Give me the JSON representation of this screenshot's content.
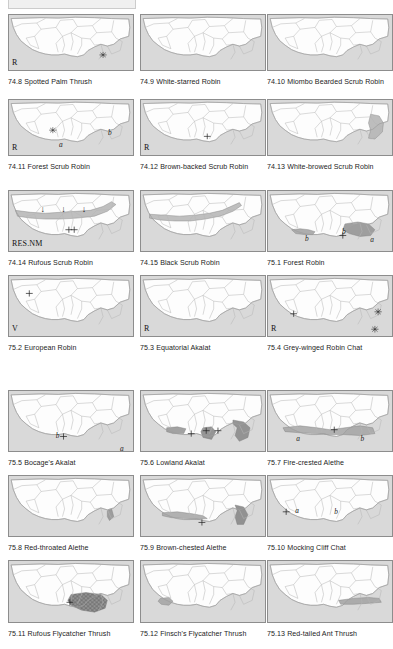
{
  "page": {
    "width": 388,
    "height": 649,
    "background": "#ffffff",
    "kind": "field-guide distribution map plate",
    "columns": 3,
    "rows": 7
  },
  "style": {
    "sea_fill": "#d9d9d9",
    "land_fill": "#fdfdfd",
    "border_stroke": "#8d8d8d",
    "country_stroke": "#b5b5b5",
    "range_light": "#b9b9b9",
    "range_dark": "#8a8a8a",
    "range_hatch": "#6f6f6f"
  },
  "legend_symbols": {
    "asterisk": "*",
    "cross": "+",
    "arrow_down": "↓",
    "subrange_a": "a",
    "subrange_b": "b"
  },
  "panels": [
    {
      "number": "74.8",
      "name": "Spotted Palm Thrush",
      "caption": "74.8 Spotted Palm Thrush",
      "status": "R",
      "markers": [
        {
          "symbol": "*",
          "x": 88,
          "y": 45
        }
      ],
      "labels": [],
      "ranges": []
    },
    {
      "number": "74.9",
      "name": "White-starred Robin",
      "caption": "74.9 White-starred Robin",
      "status": "",
      "markers": [],
      "labels": [],
      "ranges": []
    },
    {
      "number": "74.10",
      "name": "Miombo Bearded Scrub Robin",
      "caption": "74.10 Miombo Bearded Scrub Robin",
      "status": "",
      "markers": [],
      "labels": [],
      "ranges": []
    },
    {
      "number": "74.11",
      "name": "Forest Scrub Robin",
      "caption": "74.11 Forest Scrub Robin",
      "status": "R",
      "markers": [
        {
          "symbol": "*",
          "x": 41,
          "y": 34
        }
      ],
      "labels": [
        {
          "text": "a",
          "x": 47,
          "y": 46
        },
        {
          "text": "b",
          "x": 92,
          "y": 33
        }
      ],
      "ranges": []
    },
    {
      "number": "74.12",
      "name": "Brown-backed Scrub Robin",
      "caption": "74.12 Brown-backed Scrub Robin",
      "status": "R",
      "markers": [
        {
          "symbol": "+",
          "x": 62,
          "y": 41
        }
      ],
      "labels": [],
      "ranges": []
    },
    {
      "number": "74.13",
      "name": "White-browed Scrub Robin",
      "caption": "74.13 White-browed Scrub Robin",
      "status": "",
      "markers": [],
      "labels": [],
      "ranges": [
        "east-coastal-band"
      ]
    },
    {
      "number": "74.14",
      "name": "Rufous Scrub Robin",
      "caption": "74.14 Rufous Scrub Robin",
      "status": "RES.NM",
      "markers": [
        {
          "symbol": "+",
          "x": 56,
          "y": 40
        },
        {
          "symbol": "+",
          "x": 61,
          "y": 40
        }
      ],
      "labels": [
        {
          "text": "↓",
          "x": 30,
          "y": 16
        },
        {
          "text": "↓",
          "x": 49,
          "y": 16
        },
        {
          "text": "↓",
          "x": 68,
          "y": 16
        }
      ],
      "ranges": [
        "sahel-belt"
      ]
    },
    {
      "number": "74.15",
      "name": "Black Scrub Robin",
      "caption": "74.15 Black Scrub Robin",
      "status": "",
      "markers": [],
      "labels": [],
      "ranges": [
        "sahel-belt-thin"
      ]
    },
    {
      "number": "75.1",
      "name": "Forest Robin",
      "caption": "75.1 Forest Robin",
      "status": "",
      "markers": [
        {
          "symbol": "+",
          "x": 70,
          "y": 46
        }
      ],
      "labels": [
        {
          "text": "b",
          "x": 35,
          "y": 45
        },
        {
          "text": "b",
          "x": 69,
          "y": 38
        },
        {
          "text": "a",
          "x": 95,
          "y": 46
        }
      ],
      "ranges": [
        "guinea-forest",
        "congo-west"
      ]
    },
    {
      "number": "75.2",
      "name": "European Robin",
      "caption": "75.2 European Robin",
      "status": "V",
      "markers": [
        {
          "symbol": "+",
          "x": 19,
          "y": 18
        }
      ],
      "labels": [],
      "ranges": []
    },
    {
      "number": "75.3",
      "name": "Equatorial Akalat",
      "caption": "75.3 Equatorial Akalat",
      "status": "R",
      "markers": [],
      "labels": [],
      "ranges": []
    },
    {
      "number": "75.4",
      "name": "Grey-winged Robin Chat",
      "caption": "75.4 Grey-winged Robin Chat",
      "status": "R",
      "markers": [
        {
          "symbol": "+",
          "x": 24,
          "y": 39
        },
        {
          "symbol": "*",
          "x": 103,
          "y": 37
        },
        {
          "symbol": "*",
          "x": 100,
          "y": 55
        }
      ],
      "labels": [],
      "ranges": []
    },
    {
      "number": "75.5",
      "name": "Bocage's Akalat",
      "caption": "75.5 Bocage's Akalat",
      "status": "",
      "markers": [
        {
          "symbol": "+",
          "x": 51,
          "y": 47
        }
      ],
      "labels": [
        {
          "text": "b",
          "x": 44,
          "y": 42
        },
        {
          "text": "a",
          "x": 103,
          "y": 55
        }
      ],
      "ranges": []
    },
    {
      "number": "75.6",
      "name": "Lowland Akalat",
      "caption": "75.6 Lowland Akalat",
      "status": "",
      "markers": [
        {
          "symbol": "+",
          "x": 47,
          "y": 44
        },
        {
          "symbol": "+",
          "x": 61,
          "y": 41
        },
        {
          "symbol": "+",
          "x": 72,
          "y": 41
        }
      ],
      "labels": [],
      "ranges": [
        "guinea-patch",
        "cameroon-patch",
        "congo-arc"
      ]
    },
    {
      "number": "75.7",
      "name": "Fire-crested Alethe",
      "caption": "75.7 Fire-crested Alethe",
      "status": "",
      "markers": [
        {
          "symbol": "+",
          "x": 62,
          "y": 40
        }
      ],
      "labels": [
        {
          "text": "a",
          "x": 27,
          "y": 45
        },
        {
          "text": "b",
          "x": 86,
          "y": 45
        }
      ],
      "ranges": [
        "guinea-congo-stipple"
      ]
    },
    {
      "number": "75.8",
      "name": "Red-throated Alethe",
      "caption": "75.8 Red-throated Alethe",
      "status": "",
      "markers": [],
      "labels": [],
      "ranges": [
        "cameroon-sliver"
      ]
    },
    {
      "number": "75.9",
      "name": "Brown-chested Alethe",
      "caption": "75.9 Brown-chested Alethe",
      "status": "",
      "markers": [
        {
          "symbol": "+",
          "x": 57,
          "y": 48
        }
      ],
      "labels": [],
      "ranges": [
        "guinea-coast-band",
        "congo-blob"
      ]
    },
    {
      "number": "75.10",
      "name": "Mocking Cliff Chat",
      "caption": "75.10 Mocking Cliff Chat",
      "status": "",
      "markers": [
        {
          "symbol": "+",
          "x": 17,
          "y": 37
        }
      ],
      "labels": [
        {
          "text": "a",
          "x": 26,
          "y": 32
        },
        {
          "text": "b",
          "x": 62,
          "y": 33
        }
      ],
      "ranges": []
    },
    {
      "number": "75.11",
      "name": "Rufous Flycatcher Thrush",
      "caption": "75.11 Rufous Flycatcher Thrush",
      "status": "",
      "markers": [
        {
          "symbol": "+",
          "x": 57,
          "y": 42
        }
      ],
      "labels": [],
      "ranges": [
        "congo-hatched"
      ]
    },
    {
      "number": "75.12",
      "name": "Finsch's Flycatcher Thrush",
      "caption": "75.12 Finsch's Flycatcher Thrush",
      "status": "",
      "markers": [],
      "labels": [],
      "ranges": [
        "liberia-stipple"
      ]
    },
    {
      "number": "75.13",
      "name": "Red-tailed Ant Thrush",
      "caption": "75.13 Red-tailed Ant Thrush",
      "status": "",
      "markers": [],
      "labels": [],
      "ranges": [
        "gulf-coast-stipple"
      ]
    }
  ]
}
